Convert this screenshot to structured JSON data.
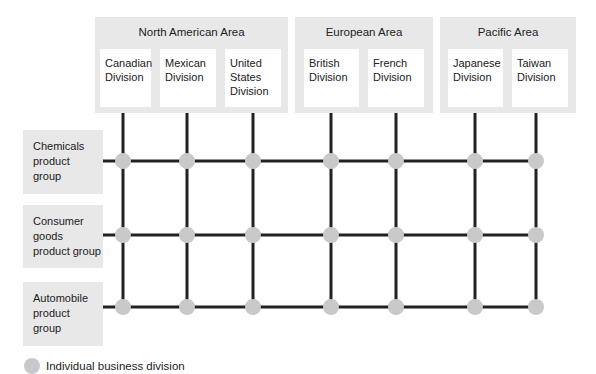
{
  "areas": [
    {
      "title": "North American Area",
      "divisions": [
        "Canadian\nDivision",
        "Mexican\nDivision",
        "United\nStates\nDivision"
      ]
    },
    {
      "title": "European Area",
      "divisions": [
        "British\nDivision",
        "French\nDivision"
      ]
    },
    {
      "title": "Pacific Area",
      "divisions": [
        "Japanese\nDivision",
        "Taiwan\nDivision"
      ]
    }
  ],
  "product_groups": [
    "Chemicals\nproduct\ngroup",
    "Consumer\ngoods\nproduct group",
    "Automobile\nproduct\ngroup"
  ],
  "legend": {
    "label": "Individual business division"
  },
  "colors": {
    "area_fill": "#e8e8e8",
    "node_fill": "#c9c9c9",
    "line": "#222222"
  }
}
